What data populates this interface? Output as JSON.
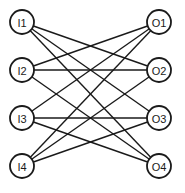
{
  "diagram": {
    "type": "bipartite-network",
    "node_radius": 12,
    "colors": {
      "stroke": "#1a1a1a",
      "fill": "#ffffff",
      "background": "#ffffff"
    },
    "input_nodes": [
      {
        "id": "I1",
        "label": "I1",
        "x": 22,
        "y": 22
      },
      {
        "id": "I2",
        "label": "I2",
        "x": 22,
        "y": 70
      },
      {
        "id": "I3",
        "label": "I3",
        "x": 22,
        "y": 118
      },
      {
        "id": "I4",
        "label": "I4",
        "x": 22,
        "y": 166
      }
    ],
    "output_nodes": [
      {
        "id": "O1",
        "label": "O1",
        "x": 159,
        "y": 22
      },
      {
        "id": "O2",
        "label": "O2",
        "x": 159,
        "y": 70
      },
      {
        "id": "O3",
        "label": "O3",
        "x": 159,
        "y": 118
      },
      {
        "id": "O4",
        "label": "O4",
        "x": 159,
        "y": 166
      }
    ],
    "edges": [
      {
        "from": "I1",
        "to": "O2"
      },
      {
        "from": "I1",
        "to": "O3"
      },
      {
        "from": "I1",
        "to": "O4"
      },
      {
        "from": "I2",
        "to": "O1"
      },
      {
        "from": "I2",
        "to": "O2"
      },
      {
        "from": "I2",
        "to": "O4"
      },
      {
        "from": "I3",
        "to": "O1"
      },
      {
        "from": "I3",
        "to": "O3"
      },
      {
        "from": "I3",
        "to": "O4"
      },
      {
        "from": "I4",
        "to": "O1"
      },
      {
        "from": "I4",
        "to": "O2"
      },
      {
        "from": "I4",
        "to": "O3"
      }
    ]
  }
}
